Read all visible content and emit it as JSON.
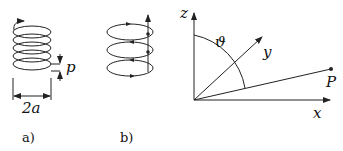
{
  "figure": {
    "panel_a": {
      "caption": "a)",
      "pitch_label": "p",
      "diameter_label": "2a",
      "description": "Helical coil with pitch p and diameter 2a"
    },
    "panel_b": {
      "caption": "b)",
      "description": "Helix decomposed into stacked current loops plus axial current"
    },
    "panel_c": {
      "axis_z_label": "z",
      "axis_y_label": "y",
      "axis_x_label": "x",
      "angle_label": "ϑ",
      "point_label": "P",
      "description": "Coordinate system with point P at polar angle theta"
    }
  },
  "colors": {
    "stroke": "#222222",
    "background": "#ffffff"
  }
}
